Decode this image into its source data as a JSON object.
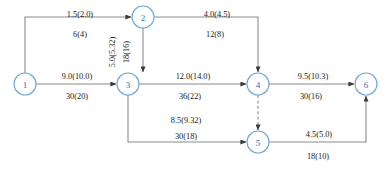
{
  "diagram": {
    "type": "directed-network-flow-graph",
    "colors": {
      "node_stroke": "#6fa8dc",
      "node_text": "#2f6fb5",
      "edge_stroke": "#8c8c8c",
      "label_text": "#1a1a1a",
      "background": "#ffffff"
    },
    "nodes": [
      {
        "id": "1",
        "label": "1",
        "x": 25,
        "y": 84,
        "r": 11
      },
      {
        "id": "2",
        "label": "2",
        "x": 143,
        "y": 17,
        "r": 11
      },
      {
        "id": "3",
        "label": "3",
        "x": 128,
        "y": 84,
        "r": 11
      },
      {
        "id": "4",
        "label": "4",
        "x": 258,
        "y": 84,
        "r": 11
      },
      {
        "id": "5",
        "label": "5",
        "x": 258,
        "y": 142,
        "r": 11
      },
      {
        "id": "6",
        "label": "6",
        "x": 366,
        "y": 84,
        "r": 11
      }
    ],
    "edges": [
      {
        "id": "e1-2",
        "from": "1",
        "to": "2",
        "style": "solid",
        "arrow": true,
        "upper_label": "1.5(2.0)",
        "lower_label": "6(4)",
        "upper_x": 80,
        "upper_y": 14,
        "lower_x": 80,
        "lower_y": 34,
        "orientation": "horizontal"
      },
      {
        "id": "e2-4",
        "from": "2",
        "to": "4",
        "style": "solid",
        "arrow": true,
        "upper_label": "4.0(4.5)",
        "lower_label": "12(8)",
        "upper_x": 217,
        "upper_y": 14,
        "lower_x": 215,
        "lower_y": 34,
        "orientation": "horizontal"
      },
      {
        "id": "e2-3",
        "from": "2",
        "to": "3",
        "style": "solid",
        "arrow": true,
        "upper_label": "5.0(5.32)",
        "lower_label": "18(16)",
        "upper_x": 112,
        "upper_y": 52,
        "lower_x": 126,
        "lower_y": 52,
        "orientation": "vertical"
      },
      {
        "id": "e1-3",
        "from": "1",
        "to": "3",
        "style": "solid",
        "arrow": true,
        "upper_label": "9.0(10.0)",
        "lower_label": "30(20)",
        "upper_x": 77,
        "upper_y": 76,
        "lower_x": 77,
        "lower_y": 96,
        "orientation": "horizontal"
      },
      {
        "id": "e3-4",
        "from": "3",
        "to": "4",
        "style": "solid",
        "arrow": true,
        "upper_label": "12.0(14.0)",
        "lower_label": "36(22)",
        "upper_x": 193,
        "upper_y": 76,
        "lower_x": 190,
        "lower_y": 96,
        "orientation": "horizontal"
      },
      {
        "id": "e4-6",
        "from": "4",
        "to": "6",
        "style": "solid",
        "arrow": true,
        "upper_label": "9.5(10.3)",
        "lower_label": "30(16)",
        "upper_x": 313,
        "upper_y": 76,
        "lower_x": 311,
        "lower_y": 96,
        "orientation": "horizontal"
      },
      {
        "id": "e3-5",
        "from": "3",
        "to": "5",
        "style": "solid",
        "arrow": true,
        "upper_label": "8.5(9.32)",
        "lower_label": "30(18)",
        "upper_x": 186,
        "upper_y": 120,
        "lower_x": 186,
        "lower_y": 142,
        "orientation": "horizontal"
      },
      {
        "id": "e5-6",
        "from": "5",
        "to": "6",
        "style": "solid",
        "arrow": true,
        "upper_label": "4.5(5.0)",
        "lower_label": "18(10)",
        "upper_x": 319,
        "upper_y": 137,
        "lower_x": 318,
        "lower_y": 157,
        "orientation": "horizontal"
      },
      {
        "id": "e4-5",
        "from": "4",
        "to": "5",
        "style": "dashed",
        "arrow": true,
        "upper_label": "",
        "lower_label": "",
        "upper_x": 0,
        "upper_y": 0,
        "lower_x": 0,
        "lower_y": 0,
        "orientation": "vertical"
      }
    ]
  }
}
